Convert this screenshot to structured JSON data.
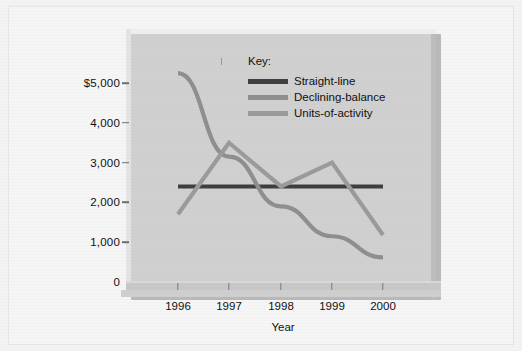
{
  "chart_data": {
    "type": "line",
    "title": "",
    "xlabel": "Year",
    "ylabel": "",
    "categories": [
      "1996",
      "1997",
      "1998",
      "1999",
      "2000"
    ],
    "ytick_labels": [
      "$5,000",
      "4,000",
      "3,000",
      "2,000",
      "1,000",
      "0"
    ],
    "ytick_values": [
      5000,
      4000,
      3000,
      2000,
      1000,
      0
    ],
    "ylim": [
      0,
      5500
    ],
    "grid": false,
    "legend_position": "top-right",
    "series": [
      {
        "name": "Straight-line",
        "color": "#3f3f3f",
        "values": [
          2400,
          2400,
          2400,
          2400,
          2400
        ]
      },
      {
        "name": "Declining-balance",
        "color": "#8f8f8f",
        "values": [
          5250,
          3150,
          1900,
          1150,
          620
        ]
      },
      {
        "name": "Units-of-activity",
        "color": "#9b9b9b",
        "values": [
          1700,
          3500,
          2400,
          3000,
          1180
        ]
      }
    ]
  },
  "legend": {
    "title": "Key:",
    "entries": [
      {
        "label": "Straight-line",
        "color": "#3f3f3f"
      },
      {
        "label": "Declining-balance",
        "color": "#8f8f8f"
      },
      {
        "label": "Units-of-activity",
        "color": "#9b9b9b"
      }
    ]
  },
  "axes": {
    "x_title": "Year",
    "x_labels": [
      "1996",
      "1997",
      "1998",
      "1999",
      "2000"
    ],
    "y_labels": [
      "$5,000",
      "4,000",
      "3,000",
      "2,000",
      "1,000",
      "0"
    ]
  },
  "colors": {
    "panel": "#d0d0d0",
    "page": "#f5f5f5",
    "straight_line": "#3f3f3f",
    "declining_balance": "#8f8f8f",
    "units_of_activity": "#9b9b9b"
  }
}
